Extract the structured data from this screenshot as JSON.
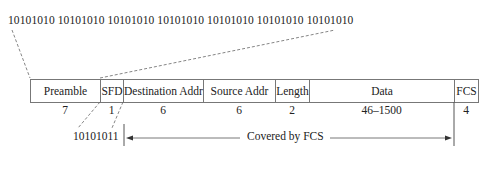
{
  "diagram": {
    "preamble_bits": "10101010 10101010 10101010 10101010 10101010 10101010 10101010",
    "sfd_bits": "10101011",
    "covered_label": "Covered by FCS",
    "fields": [
      {
        "name": "Preamble",
        "size": "7",
        "width": 70
      },
      {
        "name": "SFD",
        "size": "1",
        "width": 23
      },
      {
        "name": "Destination Addr",
        "size": "6",
        "width": 80
      },
      {
        "name": "Source Addr",
        "size": "6",
        "width": 72
      },
      {
        "name": "Length",
        "size": "2",
        "width": 34
      },
      {
        "name": "Data",
        "size": "46–1500",
        "width": 145
      },
      {
        "name": "FCS",
        "size": "4",
        "width": 24
      }
    ],
    "colors": {
      "line": "#777777",
      "text": "#222222",
      "background": "#ffffff"
    }
  }
}
